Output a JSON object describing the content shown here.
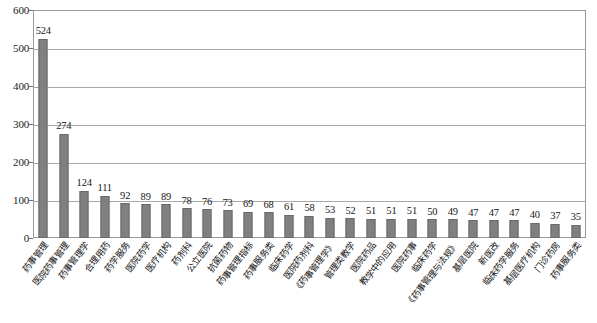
{
  "chart_data": {
    "type": "bar",
    "title": "",
    "subtitle": "",
    "xlabel": "",
    "ylabel": "",
    "ylim": [
      0,
      600
    ],
    "yticks": [
      0,
      100,
      200,
      300,
      400,
      500,
      600
    ],
    "grid": true,
    "legend": "none",
    "orientation": "vertical",
    "bar_color": "#808080",
    "bar_border_color": "#6a6a6a",
    "gridline_color": "#a8a8a8",
    "plot_border_color": "#9a9a9a",
    "background_color": "#ffffff",
    "label_rotation_deg": -52,
    "categories": [
      "药事管理",
      "医院药事管理",
      "药事管理学",
      "合理用药",
      "药学服务",
      "医院药学",
      "医疗机构",
      "药剂科",
      "公立医院",
      "抗菌药物",
      "药事管理指标",
      "药事服务类",
      "临床药学",
      "医院药剂科",
      "《药事管理学》",
      "管理类教学",
      "医院药品",
      "教学中的应用",
      "医院药事",
      "临床药学",
      "《药事管理与法规》",
      "基层医院",
      "新医改",
      "临床药学服务",
      "基层医疗机构",
      "门诊药房",
      "药事服务类"
    ],
    "values": [
      524,
      274,
      124,
      111,
      92,
      89,
      89,
      78,
      76,
      73,
      69,
      68,
      61,
      58,
      53,
      52,
      51,
      51,
      51,
      50,
      49,
      47,
      47,
      47,
      40,
      37,
      35
    ]
  }
}
